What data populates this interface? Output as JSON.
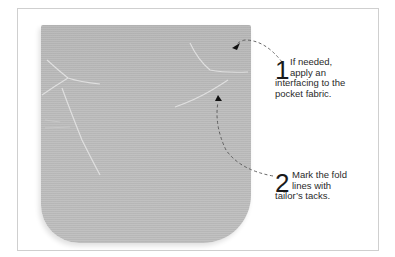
{
  "illustration": {
    "subject": "pocket-fabric",
    "fabric_color": "#bababa",
    "frame_border_color": "#cfcfcf"
  },
  "steps": [
    {
      "number": "1",
      "lines": [
        "If needed,",
        "apply an",
        "interfacing to the",
        "pocket fabric."
      ]
    },
    {
      "number": "2",
      "lines": [
        "Mark the fold",
        "lines with",
        "tailor’s tacks."
      ]
    }
  ],
  "icons": {
    "arrow1": "dashed-arrow-icon",
    "arrow2": "dashed-arrow-icon"
  }
}
